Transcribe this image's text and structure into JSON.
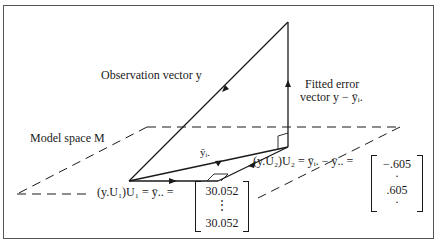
{
  "figure": {
    "labels": {
      "observation": "Observation vector y",
      "fitted_error_line1": "Fitted error",
      "fitted_error_line2": "vector y − ȳᵢ.",
      "model_space": "Model space M",
      "group_means": "ȳᵢ.",
      "projection_u1": "(y.U₁)U₁ = ȳ.. =",
      "projection_u2": "(y.U₂)U₂ = ȳᵢ. − ȳ.. ="
    },
    "matrix_u1": {
      "top": "30.052",
      "middle": "⋮",
      "bottom": "30.052"
    },
    "matrix_u2": {
      "top": "−.605",
      "dot1": "·",
      "middle": ".605",
      "dot2": "·"
    }
  }
}
